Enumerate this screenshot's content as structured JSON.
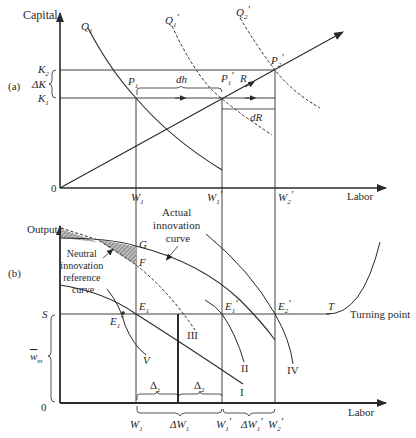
{
  "diagram": {
    "panel_a": {
      "label": "(a)",
      "y_axis_label": "Capital",
      "x_axis_label": "Labor",
      "origin_label": "0",
      "y_ticks": {
        "k2": "K",
        "k2_sub": "2",
        "delta_k": "ΔK",
        "k1": "K",
        "k1_sub": "1"
      },
      "x_ticks": {
        "w1": "W",
        "w1_sub": "1",
        "w1p": "W",
        "w1p_sub": "1",
        "w1p_prime": "'",
        "w2p": "W",
        "w2p_sub": "2",
        "w2p_prime": "'"
      },
      "curves": {
        "q1": {
          "label": "Q",
          "sub": "1",
          "style": "solid"
        },
        "q1p": {
          "label": "Q",
          "sub": "1",
          "prime": "'",
          "style": "dashed"
        },
        "q2p": {
          "label": "Q",
          "sub": "2",
          "prime": "'",
          "style": "dashed"
        }
      },
      "points": {
        "p1": {
          "label": "P",
          "sub": "1"
        },
        "p1p": {
          "label": "P",
          "sub": "1",
          "prime": "'"
        },
        "p2p": {
          "label": "P",
          "sub": "2",
          "prime": "'"
        }
      },
      "annotations": {
        "dh": "dh",
        "dR": "dR",
        "R": "R"
      }
    },
    "panel_b": {
      "label": "(b)",
      "y_axis_label": "Output",
      "x_axis_label": "Labor",
      "origin_label": "0",
      "s_label": "S",
      "wm_label": "w",
      "wm_sub": "m",
      "actual_curve_label": [
        "Actual",
        "innovation",
        "curve"
      ],
      "neutral_curve_label": [
        "Neutral",
        "innovation",
        "reference",
        "curve"
      ],
      "points": {
        "g": "G",
        "f": "F",
        "e1": {
          "label": "E",
          "sub": "1"
        },
        "e1pp": {
          "label": "E",
          "sub": "1",
          "prime": "\""
        },
        "e1p": {
          "label": "E",
          "sub": "1",
          "prime": "'"
        },
        "e2p": {
          "label": "E",
          "sub": "2",
          "prime": "'"
        },
        "t": "T"
      },
      "turning_point_label": "Turning point",
      "curve_numerals": {
        "i": "I",
        "ii": "II",
        "iii": "III",
        "iv": "IV",
        "v": "V"
      },
      "deltas": {
        "d1": "Δ",
        "d1_sub": "1",
        "d2": "Δ",
        "d2_sub": "2"
      },
      "x_ticks": {
        "w1": "W",
        "w1_sub": "1",
        "dw1": "ΔW",
        "dw1_sub": "1",
        "w1p": "W",
        "w1p_sub": "1",
        "w1p_prime": "'",
        "dw1p": "ΔW",
        "dw1p_sub": "1",
        "dw1p_prime": "'",
        "w2p": "W",
        "w2p_sub": "2",
        "w2p_prime": "'"
      }
    },
    "colors": {
      "line": "#2a2a2a",
      "hatch": "#8a8a8a",
      "background": "#ffffff"
    }
  }
}
